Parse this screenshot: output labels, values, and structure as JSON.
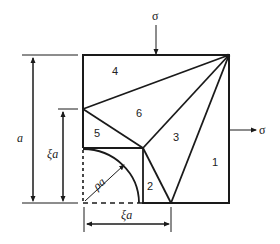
{
  "diagram": {
    "type": "stress-field decomposition of a square plate with quarter-circular hole",
    "colors": {
      "line": "#1a1a1a",
      "background": "#ffffff"
    },
    "loads": {
      "top": {
        "symbol": "σ",
        "direction": "down"
      },
      "right": {
        "symbol": "σ",
        "direction": "right"
      }
    },
    "regions": [
      {
        "id": "1",
        "label": "1"
      },
      {
        "id": "2",
        "label": "2"
      },
      {
        "id": "3",
        "label": "3"
      },
      {
        "id": "4",
        "label": "4"
      },
      {
        "id": "5",
        "label": "5"
      },
      {
        "id": "6",
        "label": "6"
      }
    ],
    "dimensions": {
      "side": {
        "label": "a"
      },
      "inner_height": {
        "label": "ξa"
      },
      "inner_width": {
        "label": "ξa"
      },
      "radius": {
        "label": "ρa"
      }
    }
  }
}
